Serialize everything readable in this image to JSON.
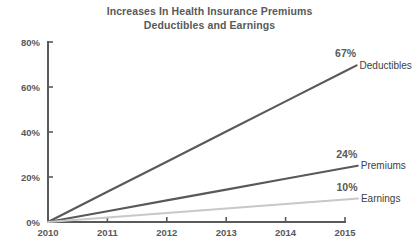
{
  "title": {
    "line1": "Increases In Health Insurance Premiums",
    "line2": "Deductibles and Earnings"
  },
  "chart_data": {
    "type": "line",
    "title": "Increases In Health Insurance Premiums Deductibles and Earnings",
    "xlabel": "",
    "ylabel": "",
    "x": [
      "2010",
      "2011",
      "2012",
      "2013",
      "2014",
      "2015"
    ],
    "xtick_labels": [
      "2010",
      "2011",
      "2012",
      "2013",
      "2014",
      "2015"
    ],
    "ytick_labels": [
      "0%",
      "20%",
      "40%",
      "60%",
      "80%"
    ],
    "ytick_values": [
      0,
      20,
      40,
      60,
      80
    ],
    "ylim": [
      0,
      80
    ],
    "grid": false,
    "legend_position": "right-inline",
    "series": [
      {
        "name": "Deductibles",
        "color": "#595959",
        "end_label": "67%",
        "end_value": 67,
        "values": [
          0,
          13.4,
          26.8,
          40.2,
          53.6,
          67
        ]
      },
      {
        "name": "Premiums",
        "color": "#595959",
        "end_label": "24%",
        "end_value": 24,
        "values": [
          0,
          4.8,
          9.6,
          14.4,
          19.2,
          24
        ]
      },
      {
        "name": "Earnings",
        "color": "#c8c8c8",
        "end_label": "10%",
        "end_value": 10,
        "values": [
          0,
          2,
          4,
          6,
          8,
          10
        ]
      }
    ],
    "annotations": [
      {
        "text": "67%",
        "series": "Deductibles"
      },
      {
        "text": "24%",
        "series": "Premiums"
      },
      {
        "text": "10%",
        "series": "Earnings"
      }
    ]
  },
  "axis": {
    "color": "#595959"
  }
}
